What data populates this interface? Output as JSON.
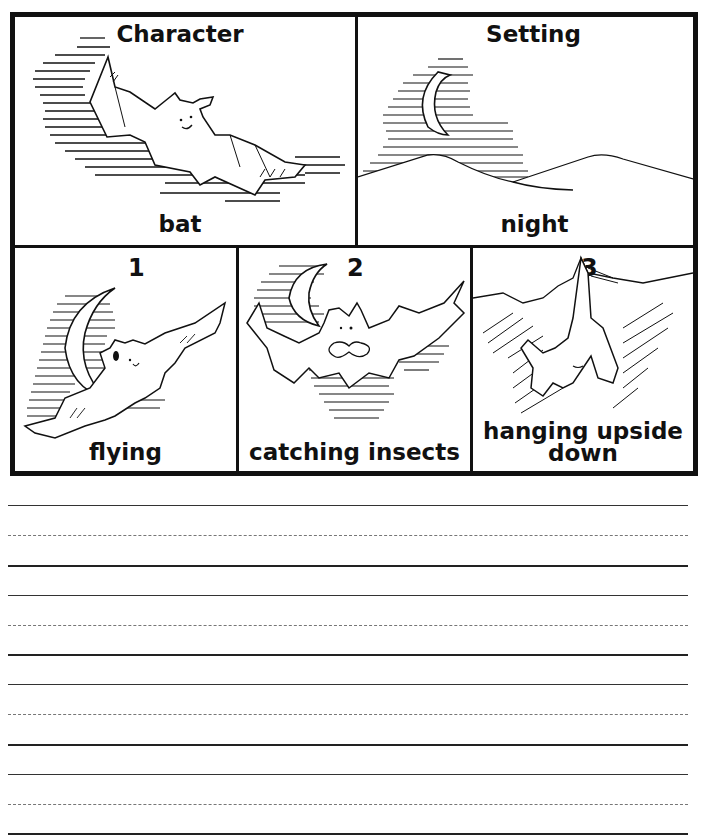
{
  "worksheet": {
    "top_panels": [
      {
        "heading": "Character",
        "answer": "bat",
        "illustration": "bat-flying-icon"
      },
      {
        "heading": "Setting",
        "answer": "night",
        "illustration": "crescent-moon-hills-icon"
      }
    ],
    "sequence_panels": [
      {
        "number": "1",
        "caption": "flying",
        "illustration": "bat-flying-moon-icon"
      },
      {
        "number": "2",
        "caption": "catching insects",
        "illustration": "bat-eating-insect-icon"
      },
      {
        "number": "3",
        "caption_line1": "hanging upside",
        "caption_line2": "down",
        "illustration": "bat-hanging-icon"
      }
    ],
    "writing_lines": {
      "groups": 4,
      "pattern": [
        "solid",
        "dashed",
        "solid"
      ]
    },
    "colors": {
      "ink": "#111111",
      "paper": "#ffffff",
      "guide_dash": "#777777"
    }
  }
}
